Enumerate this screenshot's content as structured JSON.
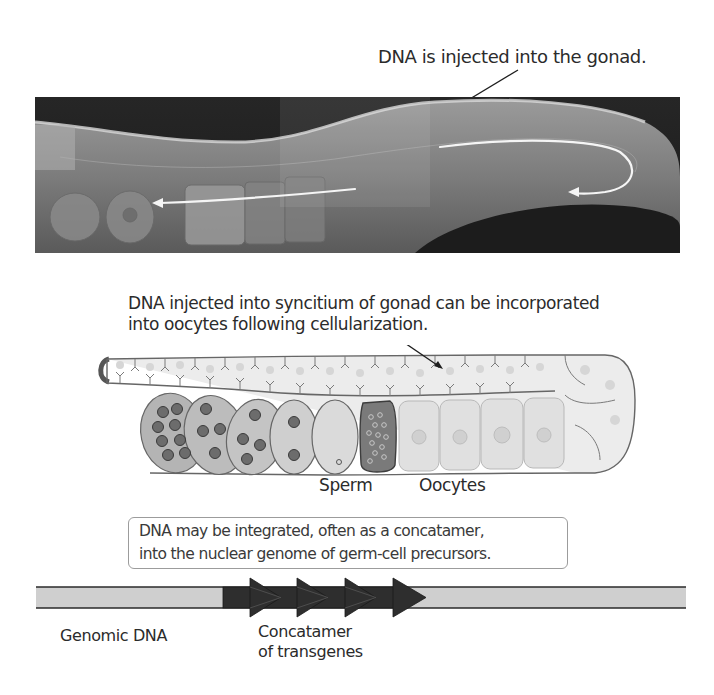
{
  "panel_top": {
    "caption": "DNA is injected into the gonad.",
    "image": "micrograph of C. elegans gonad with white arrows showing direction"
  },
  "panel_middle": {
    "caption_line1": "DNA injected into syncitium of gonad can be incorporated",
    "caption_line2": "into oocytes following cellularization.",
    "labels": {
      "sperm": "Sperm",
      "oocytes": "Oocytes"
    }
  },
  "panel_bottom": {
    "box_line1": "DNA may be integrated, often as a concatamer,",
    "box_line2": "into the nuclear genome of germ-cell precursors.",
    "genomic_label": "Genomic DNA",
    "concat_label_line1": "Concatamer",
    "concat_label_line2": "of transgenes"
  },
  "colors": {
    "genomic_dna": "#cfcfcf",
    "transgene": "#2e2e2e",
    "sperm_cell": "#7a7a7a",
    "oocyte": "#e2e2e2",
    "outline": "#5a5a5a"
  }
}
